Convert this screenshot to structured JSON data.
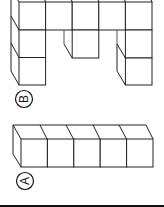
{
  "figure": {
    "orientation": "rotated 90 degrees counterclockwise",
    "colors": {
      "line": "#222222",
      "background": "#ffffff",
      "rule": "#111111"
    },
    "options": [
      {
        "label": "B",
        "description": "cube arrangement: top row of 5 cubes with hanging columns (2 cubes left, 1 cube middle, 2 cubes right)"
      },
      {
        "label": "A",
        "description": "straight row of 5 cubes"
      }
    ]
  }
}
